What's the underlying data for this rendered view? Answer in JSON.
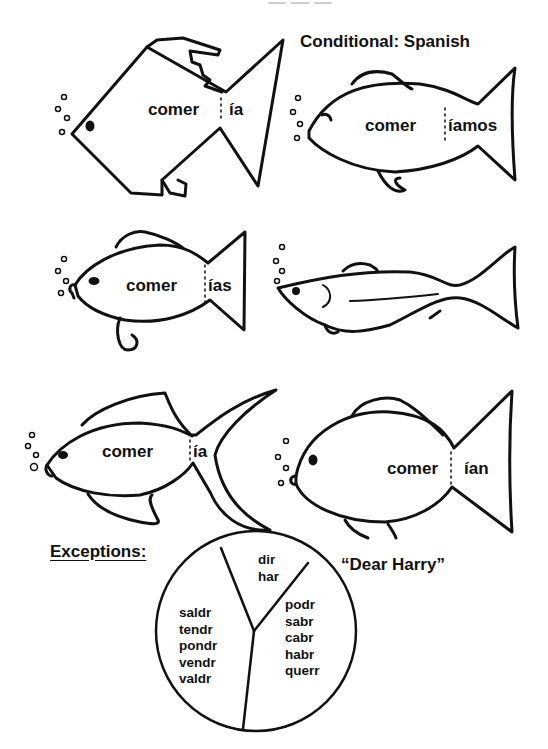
{
  "title": "Conditional:  Spanish",
  "top_faded_text": "— — —",
  "fish": [
    {
      "stem": "comer",
      "ending": "ía"
    },
    {
      "stem": "comer",
      "ending": "íamos"
    },
    {
      "stem": "comer",
      "ending": "ías"
    },
    {
      "stem": "",
      "ending": ""
    },
    {
      "stem": "comer",
      "ending": "ía"
    },
    {
      "stem": "comer",
      "ending": "ían"
    }
  ],
  "exceptions": {
    "label": "Exceptions:",
    "mnemonic": "“Dear Harry”",
    "pie": {
      "top": [
        "dir",
        "har"
      ],
      "right": [
        "podr",
        "sabr",
        "cabr",
        "habr",
        "querr"
      ],
      "left": [
        "saldr",
        "tendr",
        "pondr",
        "vendr",
        "valdr"
      ]
    }
  }
}
